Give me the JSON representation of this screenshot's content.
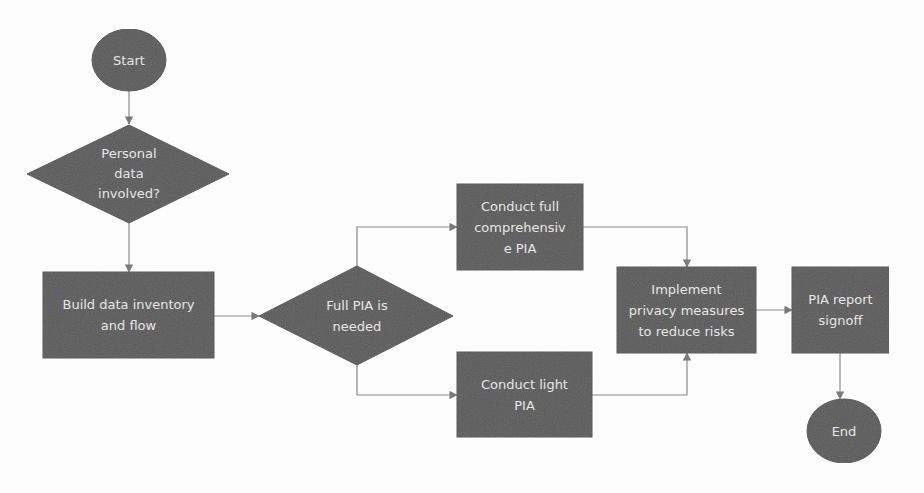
{
  "colors": {
    "background": "#fdfdfd",
    "node_fill": "#5a5a5a",
    "node_text": "#e6e6e6",
    "connector": "#8a8a8a"
  },
  "nodes": {
    "start": {
      "label": "Start",
      "shape": "ellipse"
    },
    "personal_data": {
      "label": "Personal\ndata\ninvolved?",
      "shape": "diamond"
    },
    "build_inventory": {
      "label": "Build data inventory\nand flow",
      "shape": "rectangle"
    },
    "full_pia_needed": {
      "label": "Full PIA is\nneeded",
      "shape": "diamond"
    },
    "conduct_full": {
      "label": "Conduct full\ncomprehensiv\ne PIA",
      "shape": "rectangle"
    },
    "conduct_light": {
      "label": "Conduct light\nPIA",
      "shape": "rectangle"
    },
    "implement_measures": {
      "label": "Implement\nprivacy measures\nto reduce risks",
      "shape": "rectangle"
    },
    "report_signoff": {
      "label": "PIA report\nsignoff",
      "shape": "rectangle"
    },
    "end": {
      "label": "End",
      "shape": "ellipse"
    }
  },
  "edges": [
    {
      "from": "start",
      "to": "personal_data"
    },
    {
      "from": "personal_data",
      "to": "build_inventory"
    },
    {
      "from": "build_inventory",
      "to": "full_pia_needed"
    },
    {
      "from": "full_pia_needed",
      "to": "conduct_full"
    },
    {
      "from": "full_pia_needed",
      "to": "conduct_light"
    },
    {
      "from": "conduct_full",
      "to": "implement_measures"
    },
    {
      "from": "conduct_light",
      "to": "implement_measures"
    },
    {
      "from": "implement_measures",
      "to": "report_signoff"
    },
    {
      "from": "report_signoff",
      "to": "end"
    }
  ]
}
